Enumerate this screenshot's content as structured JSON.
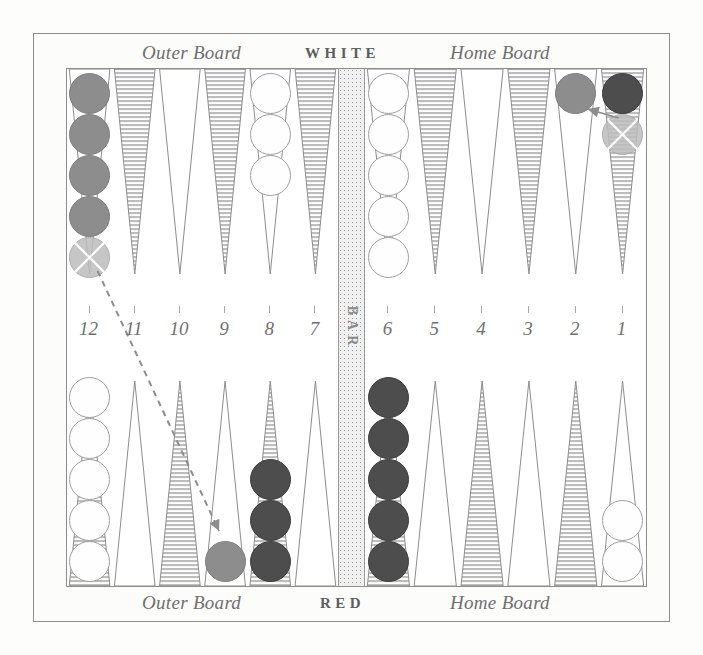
{
  "figure": {
    "bar_label": "BAR"
  },
  "labels": {
    "top_outer": "Outer Board",
    "top_player": "WHITE",
    "top_home": "Home Board",
    "bottom_outer": "Outer Board",
    "bottom_player": "RED",
    "bottom_home": "Home Board"
  },
  "point_numbers": [
    "12",
    "11",
    "10",
    "9",
    "8",
    "7",
    "6",
    "5",
    "4",
    "3",
    "2",
    "1"
  ],
  "colors": {
    "white_checker": "#fefefe",
    "gray_checker": "#8d8d8d",
    "dark_checker": "#4d4d4d",
    "ghost_checker": "#bdbdbd",
    "point_shaded": "#c9c9c9",
    "point_plain": "#ffffff",
    "line": "#8d8d8d",
    "text": "#6f6f6f",
    "bar_fill": "#f0f0f0"
  },
  "board": {
    "top_points": [
      {
        "number": "12",
        "checkers": 5,
        "color": "gray",
        "ghost_last": true
      },
      {
        "number": "11",
        "checkers": 0,
        "color": "none"
      },
      {
        "number": "10",
        "checkers": 0,
        "color": "none"
      },
      {
        "number": "9",
        "checkers": 0,
        "color": "none"
      },
      {
        "number": "8",
        "checkers": 3,
        "color": "white"
      },
      {
        "number": "7",
        "checkers": 0,
        "color": "none"
      },
      {
        "number": "6",
        "checkers": 5,
        "color": "white"
      },
      {
        "number": "5",
        "checkers": 0,
        "color": "none"
      },
      {
        "number": "4",
        "checkers": 0,
        "color": "none"
      },
      {
        "number": "3",
        "checkers": 0,
        "color": "none"
      },
      {
        "number": "2",
        "checkers": 1,
        "color": "gray"
      },
      {
        "number": "1",
        "checkers": 2,
        "color": "dark",
        "ghost_last": true
      }
    ],
    "bottom_points": [
      {
        "number": "12",
        "checkers": 5,
        "color": "white"
      },
      {
        "number": "11",
        "checkers": 0,
        "color": "none"
      },
      {
        "number": "10",
        "checkers": 0,
        "color": "none"
      },
      {
        "number": "9",
        "checkers": 1,
        "color": "gray"
      },
      {
        "number": "8",
        "checkers": 3,
        "color": "dark"
      },
      {
        "number": "7",
        "checkers": 0,
        "color": "none"
      },
      {
        "number": "6",
        "checkers": 5,
        "color": "dark"
      },
      {
        "number": "5",
        "checkers": 0,
        "color": "none"
      },
      {
        "number": "4",
        "checkers": 0,
        "color": "none"
      },
      {
        "number": "3",
        "checkers": 0,
        "color": "none"
      },
      {
        "number": "2",
        "checkers": 0,
        "color": "none"
      },
      {
        "number": "1",
        "checkers": 2,
        "color": "white"
      }
    ],
    "moves": [
      {
        "from": "top-12",
        "to": "bottom-9",
        "style": "dashed"
      },
      {
        "from": "top-1",
        "to": "top-2",
        "style": "solid"
      }
    ]
  }
}
